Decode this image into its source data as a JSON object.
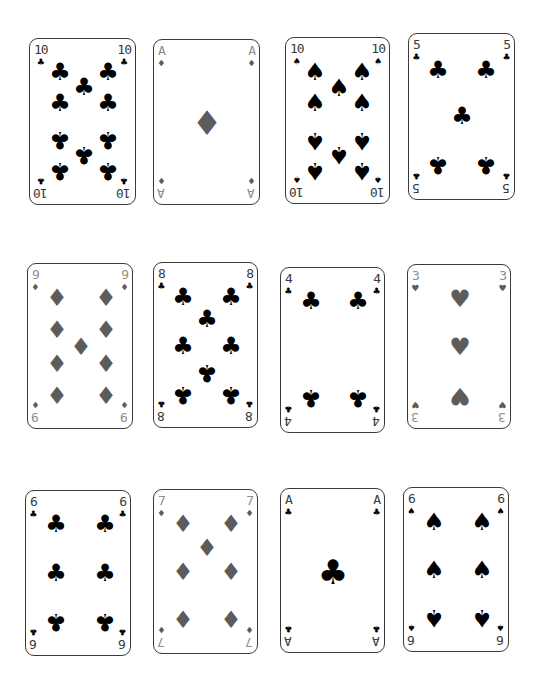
{
  "colors": {
    "black_suit": "#000000",
    "red_suit_gray": "#5c5c5c",
    "red_rank_gray": "#8e8e8e",
    "card_border": "#3a3a3a",
    "background": "#ffffff"
  },
  "suits": {
    "clubs": "♣",
    "spades": "♠",
    "diamonds": "♦",
    "hearts": "♥"
  },
  "cards": [
    {
      "rank": "10",
      "suit": "clubs",
      "suit_symbol": "♣",
      "color": "black",
      "box": [
        29,
        38,
        107,
        167
      ]
    },
    {
      "rank": "A",
      "suit": "diamonds",
      "suit_symbol": "♦",
      "color": "red",
      "box": [
        153,
        39,
        107,
        166
      ]
    },
    {
      "rank": "10",
      "suit": "spades",
      "suit_symbol": "♠",
      "color": "black",
      "box": [
        285,
        37,
        105,
        167
      ]
    },
    {
      "rank": "5",
      "suit": "clubs",
      "suit_symbol": "♣",
      "color": "black",
      "box": [
        408,
        33,
        107,
        167
      ]
    },
    {
      "rank": "9",
      "suit": "diamonds",
      "suit_symbol": "♦",
      "color": "red",
      "box": [
        27,
        263,
        106,
        166
      ]
    },
    {
      "rank": "8",
      "suit": "clubs",
      "suit_symbol": "♣",
      "color": "black",
      "box": [
        153,
        262,
        105,
        166
      ]
    },
    {
      "rank": "4",
      "suit": "clubs",
      "suit_symbol": "♣",
      "color": "black",
      "box": [
        280,
        267,
        105,
        166
      ]
    },
    {
      "rank": "3",
      "suit": "hearts",
      "suit_symbol": "♥",
      "color": "red",
      "box": [
        407,
        264,
        104,
        165
      ]
    },
    {
      "rank": "6",
      "suit": "clubs",
      "suit_symbol": "♣",
      "color": "black",
      "box": [
        25,
        490,
        106,
        166
      ]
    },
    {
      "rank": "7",
      "suit": "diamonds",
      "suit_symbol": "♦",
      "color": "red",
      "box": [
        153,
        489,
        105,
        165
      ]
    },
    {
      "rank": "A",
      "suit": "clubs",
      "suit_symbol": "♣",
      "color": "black",
      "box": [
        280,
        488,
        105,
        165
      ]
    },
    {
      "rank": "6",
      "suit": "spades",
      "suit_symbol": "♠",
      "color": "black",
      "box": [
        403,
        487,
        106,
        165
      ]
    }
  ]
}
